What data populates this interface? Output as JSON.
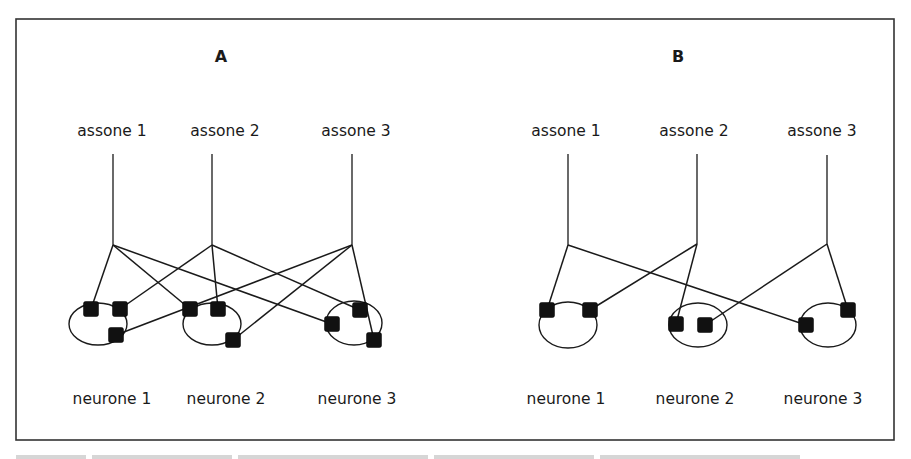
{
  "figure": {
    "frame": {
      "x": 16,
      "y": 19,
      "width": 878,
      "height": 421
    },
    "caption_visible": false,
    "panels": [
      {
        "id": "A",
        "label": "A",
        "label_pos": {
          "x": 221,
          "y": 62
        },
        "axons": [
          {
            "label": "assone 1",
            "label_x": 112,
            "top_y": 154,
            "x": 113,
            "branch_y": 245
          },
          {
            "label": "assone 2",
            "label_x": 225,
            "top_y": 154,
            "x": 212,
            "branch_y": 245
          },
          {
            "label": "assone 3",
            "label_x": 356,
            "top_y": 154,
            "x": 352,
            "branch_y": 245
          }
        ],
        "neurons": [
          {
            "label": "neurone 1",
            "label_x": 112,
            "cx": 98,
            "cy": 324,
            "rx": 29,
            "ry": 21,
            "synapses": [
              {
                "x": 91,
                "y": 309
              },
              {
                "x": 120,
                "y": 309
              },
              {
                "x": 116,
                "y": 335
              }
            ]
          },
          {
            "label": "neurone 2",
            "label_x": 226,
            "cx": 212,
            "cy": 324,
            "rx": 29,
            "ry": 21,
            "synapses": [
              {
                "x": 190,
                "y": 309
              },
              {
                "x": 218,
                "y": 309
              },
              {
                "x": 233,
                "y": 340
              }
            ]
          },
          {
            "label": "neurone 3",
            "label_x": 357,
            "cx": 354,
            "cy": 323,
            "rx": 28,
            "ry": 22,
            "synapses": [
              {
                "x": 332,
                "y": 324
              },
              {
                "x": 360,
                "y": 310
              },
              {
                "x": 374,
                "y": 340
              }
            ]
          }
        ],
        "connections": [
          {
            "axon": 0,
            "neuron": 0,
            "synapse": 0
          },
          {
            "axon": 0,
            "neuron": 1,
            "synapse": 0
          },
          {
            "axon": 0,
            "neuron": 2,
            "synapse": 0
          },
          {
            "axon": 1,
            "neuron": 0,
            "synapse": 1
          },
          {
            "axon": 1,
            "neuron": 1,
            "synapse": 1
          },
          {
            "axon": 1,
            "neuron": 2,
            "synapse": 1
          },
          {
            "axon": 2,
            "neuron": 0,
            "synapse": 2
          },
          {
            "axon": 2,
            "neuron": 1,
            "synapse": 2
          },
          {
            "axon": 2,
            "neuron": 2,
            "synapse": 2
          }
        ]
      },
      {
        "id": "B",
        "label": "B",
        "label_pos": {
          "x": 678,
          "y": 62
        },
        "axons": [
          {
            "label": "assone 1",
            "label_x": 566,
            "top_y": 154,
            "x": 568,
            "branch_y": 245
          },
          {
            "label": "assone 2",
            "label_x": 694,
            "top_y": 154,
            "x": 697,
            "branch_y": 244
          },
          {
            "label": "assone 3",
            "label_x": 822,
            "top_y": 155,
            "x": 827,
            "branch_y": 244
          }
        ],
        "neurons": [
          {
            "label": "neurone 1",
            "label_x": 566,
            "cx": 568,
            "cy": 325,
            "rx": 29,
            "ry": 23,
            "synapses": [
              {
                "x": 547,
                "y": 310
              },
              {
                "x": 590,
                "y": 310
              }
            ]
          },
          {
            "label": "neurone 2",
            "label_x": 695,
            "cx": 698,
            "cy": 325,
            "rx": 29,
            "ry": 22,
            "synapses": [
              {
                "x": 676,
                "y": 324
              },
              {
                "x": 705,
                "y": 325
              }
            ]
          },
          {
            "label": "neurone 3",
            "label_x": 823,
            "cx": 828,
            "cy": 325,
            "rx": 28,
            "ry": 22,
            "synapses": [
              {
                "x": 806,
                "y": 325
              },
              {
                "x": 848,
                "y": 310
              }
            ]
          }
        ],
        "connections": [
          {
            "axon": 0,
            "neuron": 0,
            "synapse": 0
          },
          {
            "axon": 0,
            "neuron": 2,
            "synapse": 0
          },
          {
            "axon": 1,
            "neuron": 0,
            "synapse": 1
          },
          {
            "axon": 1,
            "neuron": 1,
            "synapse": 0
          },
          {
            "axon": 2,
            "neuron": 1,
            "synapse": 1
          },
          {
            "axon": 2,
            "neuron": 2,
            "synapse": 1
          }
        ]
      }
    ],
    "axon_label_y": 136,
    "neuron_label_y": 404,
    "synapse_size": 15,
    "colors": {
      "ink": "#1a1a1a",
      "frame": "#333333",
      "background": "#ffffff"
    }
  }
}
